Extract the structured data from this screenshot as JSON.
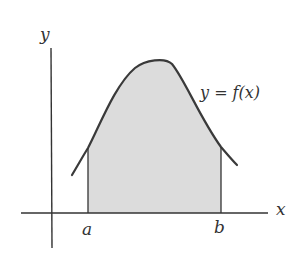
{
  "diagram": {
    "axes": {
      "x_label": "x",
      "y_label": "y"
    },
    "curve": {
      "label": "y = f(x)"
    },
    "bounds": {
      "lower": "a",
      "upper": "b"
    },
    "colors": {
      "fill": "#d9d9d9",
      "stroke": "#3a3a3a",
      "axis": "#333333"
    }
  }
}
